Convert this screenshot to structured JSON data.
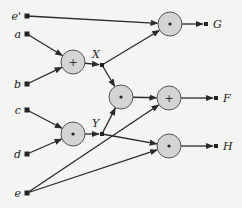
{
  "diagram": {
    "type": "arithmetic circuit",
    "inputs": [
      {
        "id": "e_prime",
        "label": "e'",
        "x": 27,
        "y": 16
      },
      {
        "id": "a",
        "label": "a",
        "x": 27,
        "y": 34
      },
      {
        "id": "b",
        "label": "b",
        "x": 27,
        "y": 84
      },
      {
        "id": "c",
        "label": "c",
        "x": 27,
        "y": 110
      },
      {
        "id": "d",
        "label": "d",
        "x": 27,
        "y": 154
      },
      {
        "id": "e",
        "label": "e",
        "x": 27,
        "y": 193
      }
    ],
    "gates": [
      {
        "id": "add1",
        "op": "+",
        "x": 73,
        "y": 62
      },
      {
        "id": "mul1",
        "op": "•",
        "x": 73,
        "y": 134
      },
      {
        "id": "mulG",
        "op": "•",
        "x": 170,
        "y": 24
      },
      {
        "id": "mulC",
        "op": "•",
        "x": 121,
        "y": 97
      },
      {
        "id": "addF",
        "op": "+",
        "x": 169,
        "y": 98
      },
      {
        "id": "mulH",
        "op": "•",
        "x": 169,
        "y": 146
      }
    ],
    "junctions": [
      {
        "id": "X",
        "label": "X",
        "x": 102,
        "y": 65
      },
      {
        "id": "Y",
        "label": "Y",
        "x": 102,
        "y": 134
      }
    ],
    "outputs": [
      {
        "id": "G",
        "label": "G",
        "x": 206,
        "y": 24
      },
      {
        "id": "F",
        "label": "F",
        "x": 216,
        "y": 98
      },
      {
        "id": "H",
        "label": "H",
        "x": 216,
        "y": 146
      }
    ],
    "edges": [
      [
        "e_prime",
        "mulG"
      ],
      [
        "a",
        "add1"
      ],
      [
        "b",
        "add1"
      ],
      [
        "add1",
        "X"
      ],
      [
        "X",
        "mulG"
      ],
      [
        "X",
        "mulC"
      ],
      [
        "c",
        "mul1"
      ],
      [
        "d",
        "mul1"
      ],
      [
        "mul1",
        "Y"
      ],
      [
        "Y",
        "mulC"
      ],
      [
        "Y",
        "mulH"
      ],
      [
        "mulC",
        "addF"
      ],
      [
        "e",
        "addF"
      ],
      [
        "e",
        "mulH"
      ],
      [
        "mulG",
        "G"
      ],
      [
        "addF",
        "F"
      ],
      [
        "mulH",
        "H"
      ]
    ]
  }
}
